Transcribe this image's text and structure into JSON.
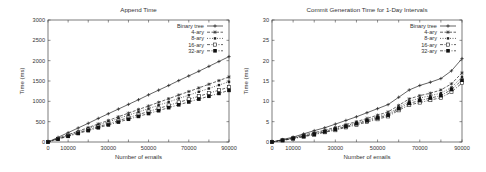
{
  "chart_data": [
    {
      "type": "line",
      "title": "Append Time",
      "xlabel": "Number of emails",
      "ylabel": "Time (ms)",
      "xlim": [
        0,
        90000
      ],
      "ylim": [
        0,
        3000
      ],
      "xticks": [
        0,
        10000,
        30000,
        50000,
        70000,
        90000
      ],
      "xticks_minor": [
        0,
        10000,
        20000,
        30000,
        40000,
        50000,
        60000,
        70000,
        80000,
        90000
      ],
      "yticks": [
        0,
        500,
        1000,
        1500,
        2000,
        2500,
        3000
      ],
      "grid": false,
      "legend_position": "top-right",
      "x": [
        0,
        5000,
        10000,
        15000,
        20000,
        25000,
        30000,
        35000,
        40000,
        45000,
        50000,
        55000,
        60000,
        65000,
        70000,
        75000,
        80000,
        85000,
        90000
      ],
      "series": [
        {
          "name": "Binary tree",
          "marker": "plus",
          "dash": "solid",
          "values": [
            0,
            115,
            230,
            345,
            460,
            580,
            695,
            810,
            925,
            1040,
            1160,
            1275,
            1390,
            1510,
            1625,
            1740,
            1860,
            1980,
            2100
          ]
        },
        {
          "name": "4-ary",
          "marker": "star",
          "dash": "dashed",
          "values": [
            0,
            90,
            180,
            265,
            355,
            445,
            530,
            620,
            710,
            800,
            885,
            975,
            1065,
            1155,
            1240,
            1330,
            1420,
            1510,
            1600
          ]
        },
        {
          "name": "8-ary",
          "marker": "smallsquare",
          "dash": "dotted",
          "values": [
            0,
            82,
            165,
            245,
            330,
            410,
            495,
            575,
            660,
            740,
            820,
            905,
            985,
            1070,
            1150,
            1235,
            1315,
            1400,
            1480
          ]
        },
        {
          "name": "16-ary",
          "marker": "opensquare",
          "dash": "dashdot",
          "values": [
            0,
            75,
            150,
            225,
            300,
            375,
            450,
            525,
            600,
            675,
            750,
            825,
            900,
            975,
            1050,
            1125,
            1200,
            1275,
            1350
          ]
        },
        {
          "name": "32-ary",
          "marker": "filledsquare",
          "dash": "dashdot",
          "values": [
            0,
            70,
            140,
            210,
            280,
            350,
            420,
            490,
            560,
            630,
            700,
            770,
            845,
            915,
            985,
            1055,
            1125,
            1195,
            1270
          ]
        }
      ]
    },
    {
      "type": "line",
      "title": "Commit Generation Time for 1-Day Intervals",
      "xlabel": "Number of emails",
      "ylabel": "Time (ms)",
      "xlim": [
        0,
        90000
      ],
      "ylim": [
        0,
        30
      ],
      "xticks": [
        0,
        10000,
        30000,
        50000,
        70000,
        90000
      ],
      "xticks_minor": [
        0,
        10000,
        20000,
        30000,
        40000,
        50000,
        60000,
        70000,
        80000,
        90000
      ],
      "yticks": [
        0,
        5,
        10,
        15,
        20,
        25,
        30
      ],
      "grid": false,
      "legend_position": "top-right",
      "x": [
        0,
        5000,
        10000,
        15000,
        20000,
        25000,
        30000,
        35000,
        40000,
        45000,
        50000,
        55000,
        60000,
        65000,
        70000,
        75000,
        80000,
        85000,
        90000
      ],
      "series": [
        {
          "name": "Binary tree",
          "marker": "plus",
          "dash": "solid",
          "values": [
            0,
            0.6,
            1.2,
            2.0,
            2.8,
            3.5,
            4.4,
            5.3,
            6.2,
            7.2,
            8.2,
            9.2,
            11.0,
            12.8,
            13.9,
            14.7,
            15.6,
            17.5,
            20.5
          ]
        },
        {
          "name": "4-ary",
          "marker": "star",
          "dash": "dashed",
          "values": [
            0,
            0.5,
            1.0,
            1.7,
            2.3,
            2.9,
            3.6,
            4.3,
            5.0,
            5.8,
            6.6,
            7.4,
            9.0,
            10.6,
            11.4,
            12.0,
            12.8,
            14.3,
            17.0
          ]
        },
        {
          "name": "8-ary",
          "marker": "smallsquare",
          "dash": "dotted",
          "values": [
            0,
            0.5,
            0.9,
            1.5,
            2.1,
            2.7,
            3.3,
            4.0,
            4.7,
            5.4,
            6.2,
            6.9,
            8.5,
            10.0,
            10.8,
            11.4,
            12.0,
            13.4,
            16.0
          ]
        },
        {
          "name": "16-ary",
          "marker": "opensquare",
          "dash": "dashdot",
          "values": [
            0,
            0.4,
            0.8,
            1.3,
            1.8,
            2.4,
            2.9,
            3.6,
            4.2,
            4.9,
            5.6,
            6.3,
            7.8,
            9.1,
            9.7,
            10.3,
            10.9,
            12.3,
            14.5
          ]
        },
        {
          "name": "32-ary",
          "marker": "filledsquare",
          "dash": "dashdot",
          "values": [
            0,
            0.4,
            0.9,
            1.4,
            1.9,
            2.5,
            3.1,
            3.8,
            4.5,
            5.2,
            5.9,
            6.6,
            8.2,
            9.5,
            10.2,
            10.8,
            11.4,
            12.9,
            15.2
          ]
        }
      ]
    }
  ],
  "charts": [
    {
      "title": "Append Time",
      "xlabel": "Number of emails",
      "ylabel": "Time (ms)"
    },
    {
      "title": "Commit Generation Time for 1-Day Intervals",
      "xlabel": "Number of emails",
      "ylabel": "Time (ms)"
    }
  ]
}
